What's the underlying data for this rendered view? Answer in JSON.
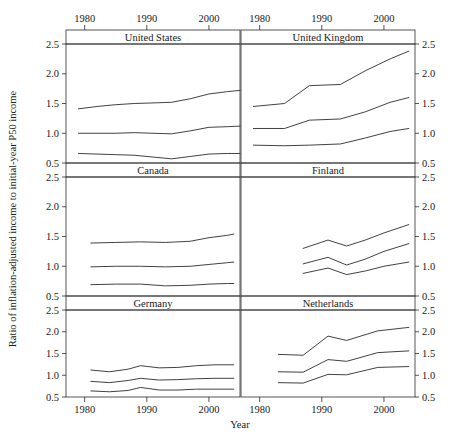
{
  "chart_data": {
    "type": "line",
    "title": "",
    "xlabel": "Year",
    "ylabel": "Ratio of inflation-adjusted income to initial-year P50 income",
    "layout": {
      "rows": 3,
      "cols": 2,
      "style": "trellis-small-multiples",
      "grid": false,
      "legend": "none"
    },
    "xlim": [
      1977,
      2005
    ],
    "ylim": [
      0.5,
      2.5
    ],
    "xticks": [
      1980,
      1990,
      2000
    ],
    "xtick_labels": [
      "1980",
      "1990",
      "2000"
    ],
    "yticks": [
      0.5,
      1.0,
      1.5,
      2.0,
      2.5
    ],
    "ytick_labels": [
      "0.5",
      "1.0",
      "1.5",
      "2.0",
      "2.5"
    ],
    "axes_positions": {
      "top_x_axis": true,
      "bottom_x_axis": true,
      "left_y_axis": true,
      "right_y_axis": true
    },
    "panels": [
      {
        "name": "United States",
        "row": 0,
        "col": 0,
        "series": [
          {
            "name": "upper",
            "x": [
              1979,
              1982,
              1985,
              1988,
              1991,
              1994,
              1997,
              2000,
              2003,
              2005
            ],
            "values": [
              1.41,
              1.45,
              1.48,
              1.5,
              1.51,
              1.52,
              1.58,
              1.66,
              1.7,
              1.72
            ]
          },
          {
            "name": "middle",
            "x": [
              1979,
              1982,
              1985,
              1988,
              1991,
              1994,
              1997,
              2000,
              2003,
              2005
            ],
            "values": [
              1.0,
              1.0,
              1.0,
              1.01,
              1.0,
              0.99,
              1.04,
              1.1,
              1.11,
              1.12
            ]
          },
          {
            "name": "lower",
            "x": [
              1979,
              1982,
              1985,
              1988,
              1991,
              1994,
              1997,
              2000,
              2003,
              2005
            ],
            "values": [
              0.66,
              0.65,
              0.64,
              0.63,
              0.6,
              0.57,
              0.61,
              0.65,
              0.66,
              0.66
            ]
          }
        ]
      },
      {
        "name": "United Kingdom",
        "row": 0,
        "col": 1,
        "series": [
          {
            "name": "upper",
            "x": [
              1979,
              1984,
              1988,
              1993,
              1997,
              2001,
              2004
            ],
            "values": [
              1.45,
              1.5,
              1.8,
              1.82,
              2.05,
              2.25,
              2.38
            ]
          },
          {
            "name": "middle",
            "x": [
              1979,
              1984,
              1988,
              1993,
              1997,
              2001,
              2004
            ],
            "values": [
              1.08,
              1.08,
              1.22,
              1.24,
              1.36,
              1.52,
              1.6
            ]
          },
          {
            "name": "lower",
            "x": [
              1979,
              1984,
              1988,
              1993,
              1997,
              2001,
              2004
            ],
            "values": [
              0.8,
              0.79,
              0.8,
              0.82,
              0.92,
              1.03,
              1.08
            ]
          }
        ]
      },
      {
        "name": "Canada",
        "row": 1,
        "col": 0,
        "series": [
          {
            "name": "upper",
            "x": [
              1981,
              1985,
              1989,
              1993,
              1997,
              2000,
              2003,
              2004
            ],
            "values": [
              1.39,
              1.4,
              1.41,
              1.4,
              1.42,
              1.48,
              1.52,
              1.54
            ]
          },
          {
            "name": "middle",
            "x": [
              1981,
              1985,
              1989,
              1993,
              1997,
              2000,
              2003,
              2004
            ],
            "values": [
              0.99,
              1.0,
              1.0,
              0.99,
              1.0,
              1.03,
              1.06,
              1.07
            ]
          },
          {
            "name": "lower",
            "x": [
              1981,
              1985,
              1989,
              1993,
              1997,
              2000,
              2003,
              2004
            ],
            "values": [
              0.69,
              0.7,
              0.7,
              0.67,
              0.68,
              0.7,
              0.71,
              0.71
            ]
          }
        ]
      },
      {
        "name": "Finland",
        "row": 1,
        "col": 1,
        "series": [
          {
            "name": "upper",
            "x": [
              1987,
              1991,
              1994,
              1997,
              2000,
              2004
            ],
            "values": [
              1.3,
              1.44,
              1.34,
              1.44,
              1.56,
              1.7
            ]
          },
          {
            "name": "middle",
            "x": [
              1987,
              1991,
              1994,
              1997,
              2000,
              2004
            ],
            "values": [
              1.04,
              1.15,
              1.02,
              1.12,
              1.25,
              1.38
            ]
          },
          {
            "name": "lower",
            "x": [
              1987,
              1991,
              1994,
              1997,
              2000,
              2004
            ],
            "values": [
              0.88,
              0.97,
              0.86,
              0.92,
              1.0,
              1.07
            ]
          }
        ]
      },
      {
        "name": "Germany",
        "row": 2,
        "col": 0,
        "series": [
          {
            "name": "upper",
            "x": [
              1981,
              1984,
              1987,
              1989,
              1992,
              1995,
              1998,
              2001,
              2004
            ],
            "values": [
              1.12,
              1.08,
              1.14,
              1.22,
              1.17,
              1.18,
              1.22,
              1.24,
              1.24
            ]
          },
          {
            "name": "middle",
            "x": [
              1981,
              1984,
              1987,
              1989,
              1992,
              1995,
              1998,
              2001,
              2004
            ],
            "values": [
              0.86,
              0.83,
              0.88,
              0.93,
              0.89,
              0.9,
              0.92,
              0.93,
              0.93
            ]
          },
          {
            "name": "lower",
            "x": [
              1981,
              1984,
              1987,
              1989,
              1992,
              1995,
              1998,
              2001,
              2004
            ],
            "values": [
              0.64,
              0.62,
              0.65,
              0.72,
              0.66,
              0.66,
              0.68,
              0.68,
              0.68
            ]
          }
        ]
      },
      {
        "name": "Netherlands",
        "row": 2,
        "col": 1,
        "series": [
          {
            "name": "upper",
            "x": [
              1983,
              1987,
              1991,
              1994,
              1999,
              2004
            ],
            "values": [
              1.48,
              1.46,
              1.9,
              1.8,
              2.02,
              2.1
            ]
          },
          {
            "name": "middle",
            "x": [
              1983,
              1987,
              1991,
              1994,
              1999,
              2004
            ],
            "values": [
              1.08,
              1.07,
              1.36,
              1.32,
              1.52,
              1.56
            ]
          },
          {
            "name": "lower",
            "x": [
              1983,
              1987,
              1991,
              1994,
              1999,
              2004
            ],
            "values": [
              0.83,
              0.82,
              1.02,
              1.01,
              1.18,
              1.2
            ]
          }
        ]
      }
    ]
  },
  "colors": {
    "line": "#2b2b2b",
    "frame": "#2b2b2b",
    "text": "#1a1a1a",
    "background": "#ffffff"
  }
}
